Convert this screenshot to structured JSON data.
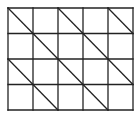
{
  "diagram": {
    "type": "grid-with-diagonals",
    "columns": 5,
    "rows": 4,
    "origin": [
      8,
      8
    ],
    "cell_width": 25,
    "cell_height": 25.5,
    "line_color": "#222222",
    "background": "#ffffff",
    "diagonals": [
      {
        "from": [
          0,
          0
        ],
        "to": [
          4,
          4
        ]
      },
      {
        "from": [
          2,
          0
        ],
        "to": [
          5,
          3
        ]
      },
      {
        "from": [
          4,
          0
        ],
        "to": [
          5,
          1
        ]
      },
      {
        "from": [
          0,
          2
        ],
        "to": [
          2,
          4
        ]
      }
    ]
  }
}
